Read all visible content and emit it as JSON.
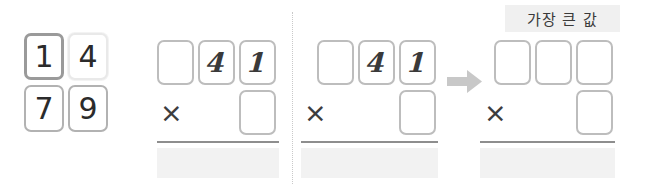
{
  "canvas": {
    "width": 645,
    "height": 192,
    "background": "#ffffff"
  },
  "colors": {
    "card_border_dark": "#9a9a9a",
    "card_border_mid": "#b2b2b2",
    "card_border_light": "#e9e9e9",
    "empty_box_border": "#bdbdbd",
    "digit": "#2b2b2b",
    "rule": "#8e8e8e",
    "answer_band": "#f2f2f2",
    "divider": "#c9c9c9",
    "label_chip_bg": "#f0f0f0",
    "arrow": "#c8c8c8"
  },
  "panels": [
    {
      "id": "number-cards",
      "name": "given-number-cards",
      "cards": [
        {
          "value": "1",
          "style": "dark",
          "row": 0,
          "col": 0
        },
        {
          "value": "4",
          "style": "light",
          "row": 0,
          "col": 1
        },
        {
          "value": "7",
          "style": "mid",
          "row": 1,
          "col": 0
        },
        {
          "value": "9",
          "style": "mid",
          "row": 1,
          "col": 1
        }
      ]
    },
    {
      "id": "step-1",
      "name": "worked-step-one",
      "top_row": [
        "",
        "4",
        "1"
      ],
      "operator": "×",
      "bottom_row": [
        ""
      ],
      "answer": ""
    },
    {
      "id": "step-2",
      "name": "worked-step-two",
      "top_row": [
        "",
        "4",
        "1"
      ],
      "operator": "×",
      "bottom_row": [
        ""
      ],
      "answer": ""
    },
    {
      "id": "result",
      "name": "largest-value-result",
      "label": "가장 큰 값",
      "top_row": [
        "",
        "",
        ""
      ],
      "operator": "×",
      "bottom_row": [
        ""
      ],
      "answer": ""
    }
  ],
  "arrow": {
    "name": "right-arrow-icon",
    "direction": "right"
  },
  "divider": {
    "name": "dotted-divider",
    "orientation": "vertical"
  }
}
